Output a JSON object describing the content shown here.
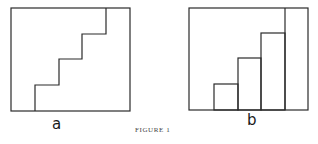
{
  "figure": {
    "caption": "FIGURE 1",
    "stroke_color": "#2a2a2a",
    "panels": [
      {
        "id": "a",
        "label": "a",
        "description": "Rectangle containing a staircase step line from bottom to top",
        "frame": {
          "x": 11,
          "y": 8,
          "w": 119,
          "h": 103
        },
        "staircase_points": [
          [
            35,
            111
          ],
          [
            35,
            85
          ],
          [
            59,
            85
          ],
          [
            59,
            59
          ],
          [
            82,
            59
          ],
          [
            82,
            34
          ],
          [
            106,
            34
          ],
          [
            106,
            8
          ]
        ]
      },
      {
        "id": "b",
        "label": "b",
        "description": "Rectangle containing ascending adjacent bars (step columns) and a full-height divider",
        "frame": {
          "x": 189,
          "y": 8,
          "w": 119,
          "h": 102
        },
        "bars": [
          {
            "x": 214,
            "w": 24,
            "top": 84
          },
          {
            "x": 238,
            "w": 23,
            "top": 58
          },
          {
            "x": 261,
            "w": 24,
            "top": 33
          }
        ],
        "divider_x": 285
      }
    ]
  }
}
